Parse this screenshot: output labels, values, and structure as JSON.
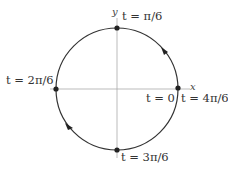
{
  "diagram": {
    "type": "unit-circle-parametrization",
    "axes": {
      "x_label": "x",
      "y_label": "y"
    },
    "points": [
      {
        "id": "top",
        "label": "t = π/6"
      },
      {
        "id": "left",
        "label": "t = 2π/6"
      },
      {
        "id": "bottom",
        "label": "t = 3π/6"
      },
      {
        "id": "right_start",
        "label": "t = 0"
      },
      {
        "id": "right_end",
        "label": "t = 4π/6"
      }
    ],
    "direction": "clockwise",
    "colors": {
      "curve": "#333333",
      "axis": "#999999",
      "point": "#222222"
    }
  }
}
